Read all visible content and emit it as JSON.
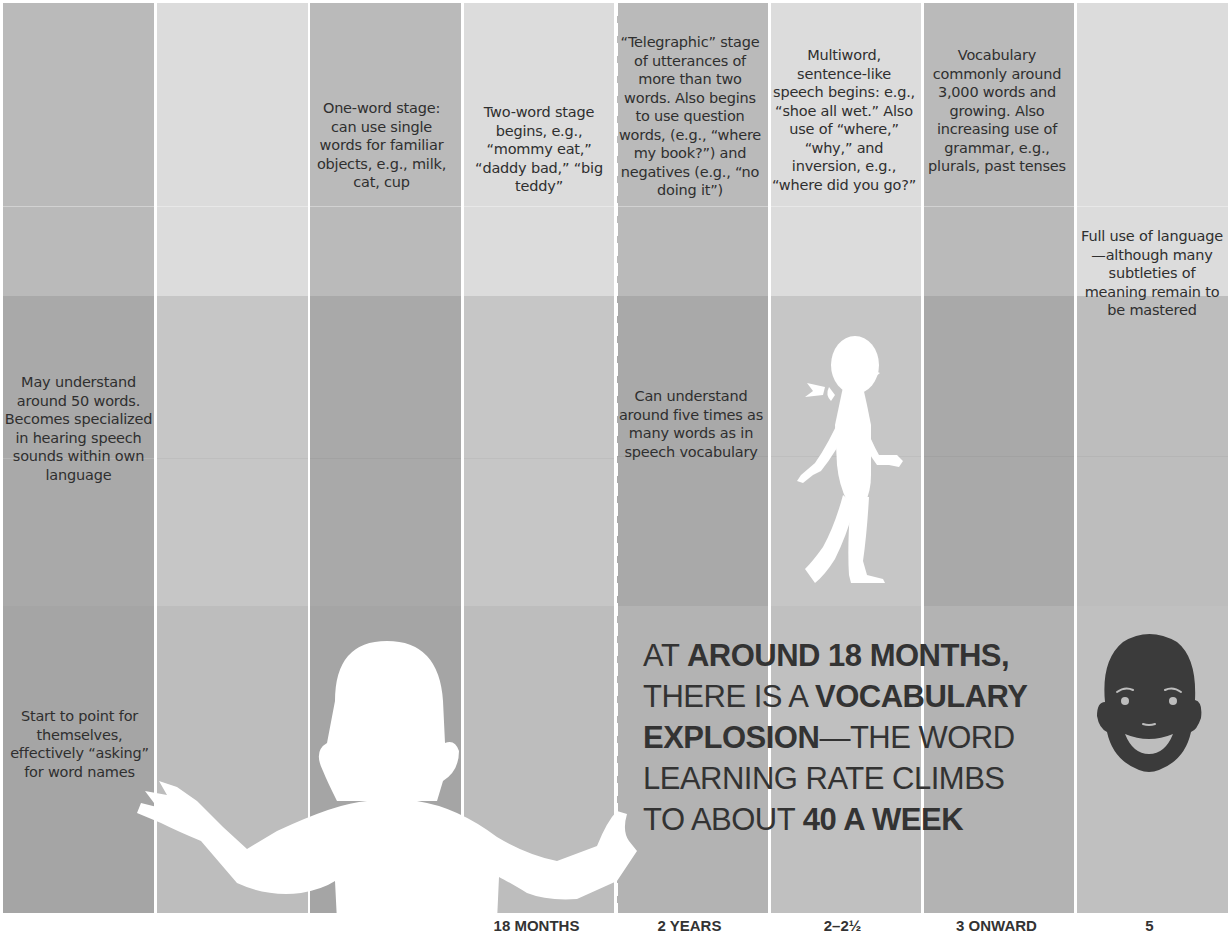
{
  "colors": {
    "col_dark": [
      "#b9b9b9",
      "#a7a7a7",
      "#a2a2a2"
    ],
    "col_light": [
      "#d9d9d9",
      "#c4c4c4",
      "#bcbcbc"
    ],
    "text": "#2f2f2f",
    "silhouette": "#ffffff",
    "face": "#3a3a3a"
  },
  "columns": [
    {
      "index": 0,
      "shade": "dark"
    },
    {
      "index": 1,
      "shade": "light"
    },
    {
      "index": 2,
      "shade": "dark"
    },
    {
      "index": 3,
      "shade": "light"
    },
    {
      "index": 4,
      "shade": "dark"
    },
    {
      "index": 5,
      "shade": "light"
    },
    {
      "index": 6,
      "shade": "dark"
    },
    {
      "index": 7,
      "shade": "light"
    }
  ],
  "speech_row": {
    "col2": "One-word stage: can use single words for familiar objects, e.g., milk, cat, cup",
    "col3": "Two-word stage begins, e.g., “mommy eat,” “daddy bad,” “big teddy”",
    "col4": "“Telegraphic” stage of utterances of more than two words. Also begins to use question words, (e.g., “where my book?”) and negatives (e.g., “no doing it”)",
    "col5": "Multiword, sentence-like speech begins: e.g., “shoe all wet.” Also use of “where,” “why,” and inversion, e.g., “where did you go?”",
    "col6": "Vocabulary commonly around 3,000 words and growing. Also increasing use of grammar, e.g., plurals, past tenses",
    "col7": "Full use of language—although many subtleties of meaning remain to be mastered"
  },
  "understanding_row": {
    "col0": "May understand around 50 words. Becomes specialized in hearing speech sounds within own language",
    "col4": "Can understand around five times as many words as in speech vocabulary"
  },
  "gesture_row": {
    "col0": "Start to point for themselves, effectively “asking” for word names"
  },
  "headline": {
    "line1_a": "At ",
    "line1_b": "around 18 months,",
    "line2_a": "there is a ",
    "line2_b": "vocabulary",
    "line3_b": "explosion",
    "line3_a": "—the word",
    "line4_a": "learning rate climbs",
    "line5_a": "to about ",
    "line5_b": "40 a week"
  },
  "ages": [
    {
      "col": 4,
      "label": "18 MONTHS"
    },
    {
      "col": 5,
      "label": "2 YEARS"
    },
    {
      "col": 6,
      "label": "2–2½"
    },
    {
      "col": 7,
      "label": "3 ONWARD"
    },
    {
      "col": 8,
      "label": "5"
    }
  ],
  "icons": {
    "baby": "baby-silhouette-icon",
    "girl": "walking-girl-silhouette-icon",
    "face": "smiling-child-face-icon"
  }
}
